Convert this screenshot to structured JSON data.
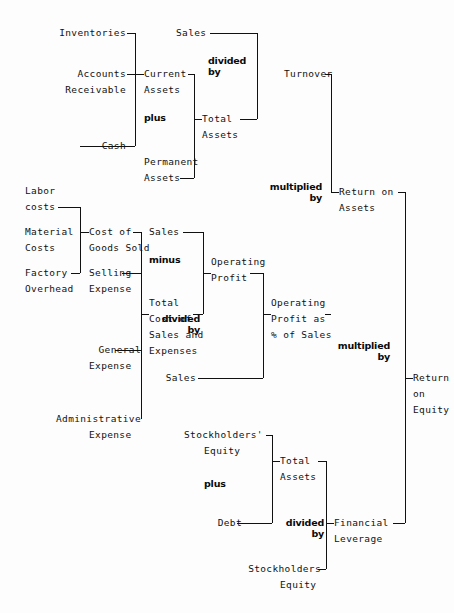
{
  "diagram": {
    "background_color": "#fdfdfd",
    "line_color": "#111111",
    "text_color": "#111111",
    "operators": {
      "divided_by_1": "divided\nby",
      "plus_1": "plus",
      "multiplied_by_1": "multiplied\nby",
      "minus_1": "minus",
      "divided_by_2": "divided\nby",
      "multiplied_by_2": "multiplied\nby",
      "plus_2": "plus",
      "divided_by_3": "divided\nby"
    },
    "labels": {
      "inventories": "Inventories",
      "accounts": "Accounts",
      "receivable": "Receivable",
      "cash": "Cash",
      "current": "Current",
      "assets_current": "Assets",
      "permanent": "Permanent",
      "assets_permanent": "Assets",
      "sales_top": "Sales",
      "total_assets_top": "Total",
      "assets_total_top": "Assets",
      "turnover": "Turnover",
      "labor": "Labor",
      "labor_costs": "costs",
      "material": "Material",
      "material_costs": "Costs",
      "factory": "Factory",
      "factory_overhead": "Overhead",
      "cost_of": "Cost of",
      "goods_sold": "Goods Sold",
      "selling": "Selling",
      "selling_expense": "Expense",
      "general": "General",
      "general_expense": "Expense",
      "administrative": "Administrative",
      "administrative_expense": "Expense",
      "sales_mid": "Sales",
      "total_cost_1": "Total",
      "total_cost_2": "Cost of",
      "total_cost_3": "Sales and",
      "total_cost_4": "Expenses",
      "operating": "Operating",
      "profit": "Profit",
      "sales_denom": "Sales",
      "op_profit_as_1": "Operating",
      "op_profit_as_2": "Profit as",
      "op_profit_as_3": "% of Sales",
      "return_on": "Return on",
      "return_assets": "Assets",
      "return_roe_1": "Return",
      "return_roe_2": "on",
      "return_roe_3": "Equity",
      "stockholders_equity_1": "Stockholders'",
      "stockholders_equity_2": "Equity",
      "debt": "Debt",
      "total_assets_bot": "Total",
      "assets_total_bot": "Assets",
      "stockholders_denom_1": "Stockholders",
      "stockholders_denom_2": "Equity",
      "financial": "Financial",
      "leverage": "Leverage"
    }
  }
}
